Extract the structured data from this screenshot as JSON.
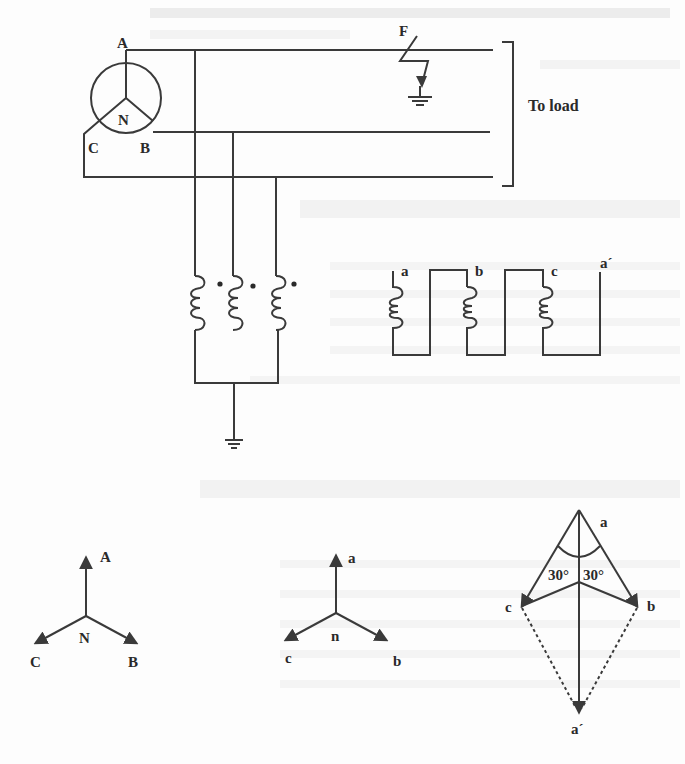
{
  "figure": {
    "colors": {
      "ink": "#3a3a3a",
      "label": "#2a2a2a",
      "background": "#fdfdfd",
      "bleed_through": "#ececec"
    }
  },
  "top_circuit": {
    "generator": {
      "terminal_a": "A",
      "terminal_b": "B",
      "terminal_c": "C",
      "neutral": "N"
    },
    "fault_label": "F",
    "load_label": "To load",
    "grounding_transformer": {
      "primary_coils": 3,
      "polarity_dots": 3,
      "ground": "ground-symbol"
    },
    "secondary_winding": {
      "terminals": [
        "a",
        "b",
        "c",
        "a´"
      ]
    }
  },
  "phasors": {
    "primary": {
      "labels": [
        "A",
        "B",
        "C"
      ],
      "center": "N"
    },
    "secondary": {
      "labels": [
        "a",
        "b",
        "c"
      ],
      "center": "n"
    },
    "broken_delta": {
      "labels": [
        "a",
        "b",
        "c",
        "a´"
      ],
      "angle_left": "30°",
      "angle_right": "30°"
    }
  }
}
